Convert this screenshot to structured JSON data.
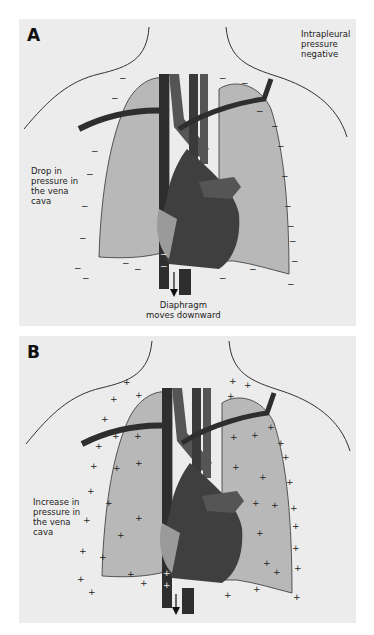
{
  "colors": {
    "background": "#ffffff",
    "panel": "#ececec",
    "lung": "#b8b8b8",
    "heart": "#3f3f3f",
    "vessel_dark": "#2e2e2e",
    "vessel_mid": "#555555",
    "atrium": "#9a9a9a",
    "outline": "#333333"
  },
  "panel_a": {
    "letter": "A",
    "label_intrapleural": "Intrapleural\npressure\nnegative",
    "label_vena_cava": "Drop in\npressure in\nthe vena\ncava",
    "label_diaphragm": "Diaphragm\nmoves downward",
    "pressure_sign": "−",
    "arrow": "down-arrow"
  },
  "panel_b": {
    "letter": "B",
    "label_vena_cava": "Increase in\npressure in\nthe vena\ncava",
    "pressure_sign": "+",
    "arrow": "down-arrow"
  }
}
